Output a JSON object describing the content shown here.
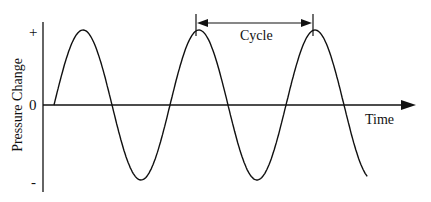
{
  "diagram": {
    "title": "",
    "y_axis_label": "Pressure Change",
    "x_axis_label": "Time",
    "y_ticks": {
      "plus": "+",
      "zero": "0",
      "minus": "-"
    },
    "annotation": "Cycle",
    "colors": {
      "line": "#111111",
      "background": "#ffffff"
    },
    "wave": {
      "type": "sine",
      "cycles_shown": 2.7,
      "start_x": 54,
      "zero_y": 105,
      "amplitude_px": 75,
      "period_px": 116
    }
  }
}
